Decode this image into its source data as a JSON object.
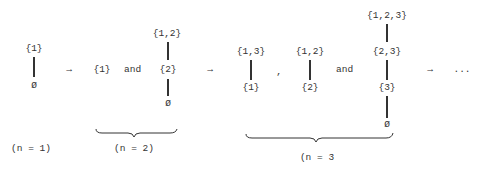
{
  "diagram": {
    "stages": [
      {
        "label": "(n = 1)",
        "chains": [
          {
            "nodes": [
              "{1}",
              "Ø"
            ]
          }
        ]
      },
      {
        "label": "(n = 2)",
        "chains": [
          {
            "nodes": [
              "{1}"
            ]
          },
          {
            "nodes": [
              "{1,2}",
              "{2}",
              "Ø"
            ]
          }
        ],
        "connectors": [
          "and"
        ]
      },
      {
        "label": "(n = 3",
        "chains": [
          {
            "nodes": [
              "{1,3}",
              "{1}"
            ]
          },
          {
            "nodes": [
              "{1,2}",
              "{2}"
            ]
          },
          {
            "nodes": [
              "{1,2,3}",
              "{2,3}",
              "{3}",
              "Ø"
            ]
          }
        ],
        "connectors": [
          ",",
          "and"
        ]
      }
    ],
    "arrows": [
      "→",
      "→",
      "→"
    ],
    "ellipsis": "..."
  }
}
